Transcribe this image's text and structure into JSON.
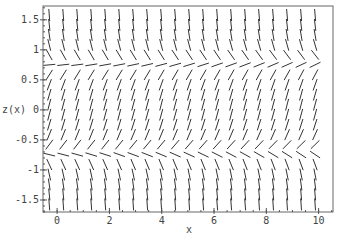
{
  "chart_data": {
    "type": "direction-field",
    "title": "",
    "xlabel": "x",
    "ylabel": "z(x)",
    "xlim": [
      -0.54,
      10.55
    ],
    "ylim": [
      -1.7,
      1.73
    ],
    "xticks": [
      0,
      2,
      4,
      6,
      8,
      10
    ],
    "xtick_labels": [
      "0",
      "2",
      "4",
      "6",
      "8",
      "10"
    ],
    "yticks": [
      1.5,
      1,
      0.5,
      0,
      -0.5,
      -1,
      -1.5
    ],
    "ytick_labels": [
      "1.5",
      "1",
      "0.5",
      "0",
      "-0.5",
      "-1",
      "-1.5"
    ],
    "grid": false,
    "legend": null,
    "field": {
      "description": "slope field of dz/dx with equilibria near z = +0.76 and z = -0.72; positive slope between them, negative slope outside",
      "equation": "dz/dx = k*(c_top - z)*(z - c_bot)",
      "k": 3.0,
      "c_top": 0.76,
      "c_bot": -0.72,
      "c_drift_per_unit_x": 0.004,
      "columns": 20,
      "rows": 20,
      "x_start": -0.3,
      "x_step": 0.535,
      "z_start": 1.58,
      "z_step": -0.166,
      "segment_length_px": 12
    },
    "colors": {
      "segment": "#333333",
      "frame": "#666666",
      "tick": "#555555"
    }
  }
}
